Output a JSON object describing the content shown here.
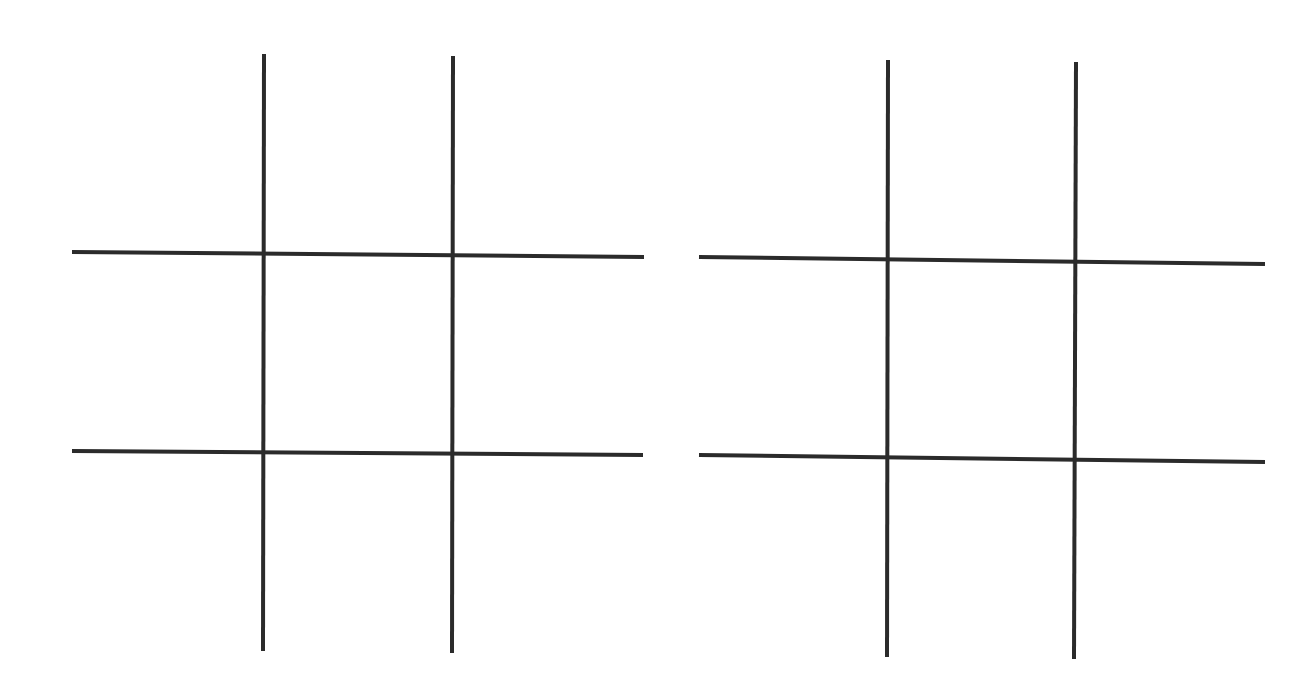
{
  "title": "",
  "line_color": "#2b2b2b",
  "boards": [
    {
      "name": "left",
      "cells": [
        [
          "",
          "",
          ""
        ],
        [
          "",
          "",
          ""
        ],
        [
          "",
          "",
          ""
        ]
      ],
      "lines": {
        "v1": [
          264,
          54,
          263,
          651
        ],
        "v2": [
          453,
          56,
          452,
          653
        ],
        "h1": [
          72,
          252,
          644,
          257
        ],
        "h2": [
          72,
          451,
          643,
          455
        ]
      }
    },
    {
      "name": "right",
      "cells": [
        [
          "",
          "",
          ""
        ],
        [
          "",
          "",
          ""
        ],
        [
          "",
          "",
          ""
        ]
      ],
      "lines": {
        "v1": [
          888,
          60,
          887,
          657
        ],
        "v2": [
          1076,
          62,
          1074,
          659
        ],
        "h1": [
          699,
          257,
          1265,
          264
        ],
        "h2": [
          699,
          455,
          1265,
          462
        ]
      }
    }
  ]
}
